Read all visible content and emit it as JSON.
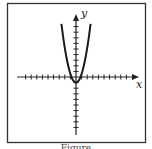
{
  "chart_data": {
    "type": "line",
    "title": "",
    "xlabel": "x",
    "ylabel": "y",
    "function": "y = x^2 - 1",
    "xlim": [
      -10,
      10
    ],
    "ylim": [
      -10,
      10
    ],
    "grid": false,
    "legend": null,
    "x_ticks": [
      -9,
      -8,
      -7,
      -6,
      -5,
      -4,
      -3,
      -2,
      -1,
      1,
      2,
      3,
      4,
      5,
      6,
      7,
      8,
      9
    ],
    "y_ticks": [
      -9,
      -8,
      -7,
      -6,
      -5,
      -4,
      -3,
      -2,
      -1,
      1,
      2,
      3,
      4,
      5,
      6,
      7,
      8,
      9
    ],
    "series": [
      {
        "name": "parabola",
        "x": [
          -2.6,
          -2,
          -1.5,
          -1,
          -0.5,
          0,
          0.5,
          1,
          1.5,
          2,
          2.6
        ],
        "y": [
          9.5,
          5,
          2.4,
          0,
          -0.6,
          -1,
          -0.6,
          0,
          2.4,
          5,
          9.5
        ]
      }
    ]
  },
  "figure": {
    "x_axis_label": "x",
    "y_axis_label": "y",
    "caption": "Figure"
  },
  "colors": {
    "frame": "#333333",
    "axis": "#222222",
    "curve": "#1a1a1a"
  }
}
